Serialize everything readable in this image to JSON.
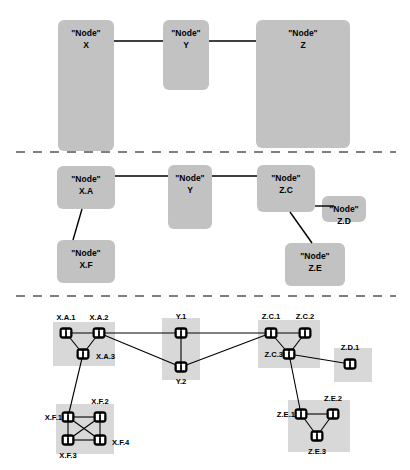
{
  "diagram": {
    "node_prefix": "\"Node\"",
    "colors": {
      "abstract_box": "#c2c2c2",
      "cluster_band": "#d8d8d8",
      "edge": "#000000",
      "divider": "#555555",
      "switch_body": "#000000",
      "switch_eye": "#ffffff",
      "background": "#ffffff"
    },
    "tiers": [
      {
        "id": "tier-1",
        "name": "top-level-abstraction",
        "boxes": [
          {
            "id": "X",
            "label_top": "\"Node\"",
            "label_bottom": "X",
            "x": 58,
            "y": 20,
            "w": 56,
            "h": 131
          },
          {
            "id": "Y",
            "label_top": "\"Node\"",
            "label_bottom": "Y",
            "x": 163,
            "y": 20,
            "w": 46,
            "h": 70
          },
          {
            "id": "Z",
            "label_top": "\"Node\"",
            "label_bottom": "Z",
            "x": 256,
            "y": 20,
            "w": 94,
            "h": 128
          }
        ],
        "links": [
          {
            "from": "X",
            "to": "Y",
            "x1": 114,
            "y1": 41,
            "x2": 163,
            "y2": 41
          },
          {
            "from": "Y",
            "to": "Z",
            "x1": 209,
            "y1": 41,
            "x2": 256,
            "y2": 41
          }
        ]
      },
      {
        "id": "tier-2",
        "name": "mid-level-refinement",
        "boxes": [
          {
            "id": "X.A",
            "label_top": "\"Node\"",
            "label_bottom": "X.A",
            "x": 57,
            "y": 166,
            "w": 58,
            "h": 43
          },
          {
            "id": "X.F",
            "label_top": "\"Node\"",
            "label_bottom": "X.F",
            "x": 57,
            "y": 240,
            "w": 58,
            "h": 43
          },
          {
            "id": "Y",
            "label_top": "\"Node\"",
            "label_bottom": "Y",
            "x": 168,
            "y": 165,
            "w": 44,
            "h": 64
          },
          {
            "id": "Z.C",
            "label_top": "\"Node\"",
            "label_bottom": "Z.C",
            "x": 257,
            "y": 165,
            "w": 58,
            "h": 47
          },
          {
            "id": "Z.D",
            "label_top": "\"Node\"",
            "label_bottom": "Z.D",
            "x": 322,
            "y": 196,
            "w": 44,
            "h": 26
          },
          {
            "id": "Z.E",
            "label_top": "\"Node\"",
            "label_bottom": "Z.E",
            "x": 285,
            "y": 243,
            "w": 60,
            "h": 43
          }
        ],
        "links": [
          {
            "from": "X.A",
            "to": "Y",
            "x1": 115,
            "y1": 176,
            "x2": 168,
            "y2": 176
          },
          {
            "from": "Y",
            "to": "Z.C",
            "x1": 212,
            "y1": 176,
            "x2": 257,
            "y2": 176
          },
          {
            "from": "X.A",
            "to": "X.F",
            "x1": 82,
            "y1": 209,
            "x2": 73,
            "y2": 240
          },
          {
            "from": "Z.C",
            "to": "Z.D",
            "x1": 315,
            "y1": 206,
            "x2": 334,
            "y2": 206
          },
          {
            "from": "Z.C",
            "to": "Z.E",
            "x1": 290,
            "y1": 212,
            "x2": 312,
            "y2": 243
          }
        ]
      }
    ],
    "tier3": {
      "id": "tier-3",
      "name": "physical-topology",
      "bands": [
        {
          "id": "band-X.A",
          "x": 53,
          "y": 322,
          "w": 62,
          "h": 44
        },
        {
          "id": "band-X.F",
          "x": 56,
          "y": 404,
          "w": 58,
          "h": 50
        },
        {
          "id": "band-Y",
          "x": 162,
          "y": 318,
          "w": 38,
          "h": 62
        },
        {
          "id": "band-Z.C",
          "x": 258,
          "y": 320,
          "w": 62,
          "h": 48
        },
        {
          "id": "band-Z.D",
          "x": 334,
          "y": 348,
          "w": 38,
          "h": 34
        },
        {
          "id": "band-Z.E",
          "x": 288,
          "y": 400,
          "w": 62,
          "h": 52
        }
      ],
      "nodes": [
        {
          "id": "X.A.1",
          "label": "X.A.1",
          "cx": 66,
          "cy": 333,
          "lx": 66,
          "ly": 318,
          "anchor": "middle"
        },
        {
          "id": "X.A.2",
          "label": "X.A.2",
          "cx": 99,
          "cy": 333,
          "lx": 99,
          "ly": 318,
          "anchor": "middle"
        },
        {
          "id": "X.A.3",
          "label": "X.A.3",
          "cx": 83,
          "cy": 354,
          "lx": 96,
          "ly": 357,
          "anchor": "start"
        },
        {
          "id": "X.F.1",
          "label": "X.F.1",
          "cx": 68,
          "cy": 417,
          "lx": 62,
          "ly": 418,
          "anchor": "end"
        },
        {
          "id": "X.F.2",
          "label": "X.F.2",
          "cx": 100,
          "cy": 417,
          "lx": 100,
          "ly": 402,
          "anchor": "middle"
        },
        {
          "id": "X.F.3",
          "label": "X.F.3",
          "cx": 68,
          "cy": 440,
          "lx": 68,
          "ly": 456,
          "anchor": "middle"
        },
        {
          "id": "X.F.4",
          "label": "X.F.4",
          "cx": 100,
          "cy": 440,
          "lx": 112,
          "ly": 443,
          "anchor": "start"
        },
        {
          "id": "Y.1",
          "label": "Y.1",
          "cx": 181,
          "cy": 333,
          "lx": 181,
          "ly": 317,
          "anchor": "middle"
        },
        {
          "id": "Y.2",
          "label": "Y.2",
          "cx": 181,
          "cy": 367,
          "lx": 181,
          "ly": 382,
          "anchor": "middle"
        },
        {
          "id": "Z.C.1",
          "label": "Z.C.1",
          "cx": 271,
          "cy": 333,
          "lx": 271,
          "ly": 317,
          "anchor": "middle"
        },
        {
          "id": "Z.C.2",
          "label": "Z.C.2",
          "cx": 305,
          "cy": 333,
          "lx": 305,
          "ly": 317,
          "anchor": "middle"
        },
        {
          "id": "Z.C.3",
          "label": "Z.C.3",
          "cx": 289,
          "cy": 354,
          "lx": 283,
          "ly": 355,
          "anchor": "end"
        },
        {
          "id": "Z.D.1",
          "label": "Z.D.1",
          "cx": 350,
          "cy": 364,
          "lx": 350,
          "ly": 348,
          "anchor": "middle"
        },
        {
          "id": "Z.E.1",
          "label": "Z.E.1",
          "cx": 301,
          "cy": 414,
          "lx": 295,
          "ly": 415,
          "anchor": "end"
        },
        {
          "id": "Z.E.2",
          "label": "Z.E.2",
          "cx": 333,
          "cy": 414,
          "lx": 333,
          "ly": 399,
          "anchor": "middle"
        },
        {
          "id": "Z.E.3",
          "label": "Z.E.3",
          "cx": 317,
          "cy": 436,
          "lx": 317,
          "ly": 452,
          "anchor": "middle"
        }
      ],
      "edges": [
        {
          "from": "X.A.1",
          "to": "X.A.2"
        },
        {
          "from": "X.A.1",
          "to": "X.A.3"
        },
        {
          "from": "X.A.2",
          "to": "X.A.3"
        },
        {
          "from": "X.A.2",
          "to": "Y.1"
        },
        {
          "from": "X.A.2",
          "to": "Y.2"
        },
        {
          "from": "X.A.3",
          "to": "X.F.1"
        },
        {
          "from": "X.F.1",
          "to": "X.F.2"
        },
        {
          "from": "X.F.1",
          "to": "X.F.3"
        },
        {
          "from": "X.F.1",
          "to": "X.F.4"
        },
        {
          "from": "X.F.2",
          "to": "X.F.3"
        },
        {
          "from": "X.F.2",
          "to": "X.F.4"
        },
        {
          "from": "X.F.3",
          "to": "X.F.4"
        },
        {
          "from": "Y.1",
          "to": "Y.2"
        },
        {
          "from": "Y.1",
          "to": "Z.C.1"
        },
        {
          "from": "Y.2",
          "to": "Z.C.1"
        },
        {
          "from": "Z.C.1",
          "to": "Z.C.2"
        },
        {
          "from": "Z.C.1",
          "to": "Z.C.3"
        },
        {
          "from": "Z.C.2",
          "to": "Z.C.3"
        },
        {
          "from": "Z.C.3",
          "to": "Z.D.1"
        },
        {
          "from": "Z.C.3",
          "to": "Z.E.1"
        },
        {
          "from": "Z.E.1",
          "to": "Z.E.2"
        },
        {
          "from": "Z.E.1",
          "to": "Z.E.3"
        },
        {
          "from": "Z.E.2",
          "to": "Z.E.3"
        }
      ]
    },
    "dividers": [
      {
        "id": "divider-1",
        "x1": 16,
        "y1": 152,
        "x2": 396,
        "y2": 152
      },
      {
        "id": "divider-2",
        "x1": 16,
        "y1": 296,
        "x2": 396,
        "y2": 296
      }
    ]
  }
}
